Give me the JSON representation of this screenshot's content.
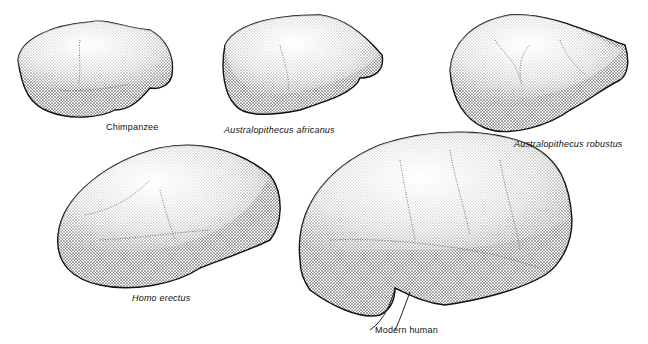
{
  "figure": {
    "type": "comparative brain illustration (lateral view, stippled)",
    "colors": {
      "background": "#ffffff",
      "ink": "#111111"
    },
    "brains": [
      {
        "id": "chimpanzee",
        "label": "Chimpanzee",
        "italic": false
      },
      {
        "id": "australopithecus-africanus",
        "label": "Australopithecus africanus",
        "italic": true
      },
      {
        "id": "australopithecus-robustus",
        "label": "Australopithecus robustus",
        "italic": true
      },
      {
        "id": "homo-erectus",
        "label": "Homo erectus",
        "italic": true
      },
      {
        "id": "modern-human",
        "label": "Modern human",
        "italic": false
      }
    ]
  }
}
